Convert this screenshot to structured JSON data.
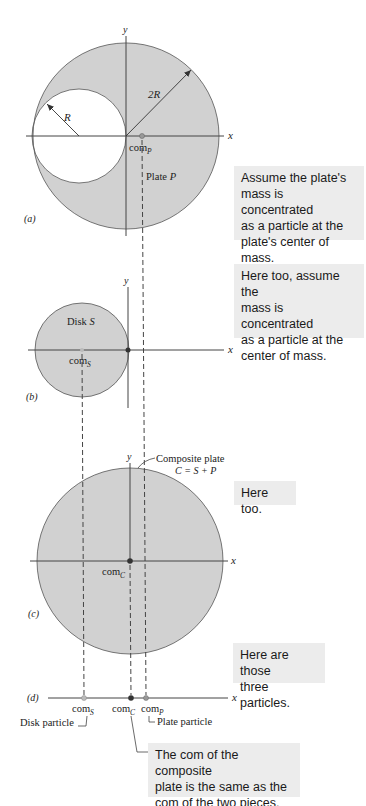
{
  "panels": {
    "a": {
      "label": "(a)",
      "x_axis": "x",
      "y_axis": "y",
      "outer_radius_label": "2R",
      "hole_radius_label": "R",
      "com_label": "com",
      "com_subscript": "P",
      "plate_label": "Plate",
      "plate_symbol": "P",
      "callout": "Assume the plate's\nmass is concentrated\nas a particle at the\nplate's center of mass."
    },
    "b": {
      "label": "(b)",
      "x_axis": "x",
      "y_axis": "y",
      "disk_label": "Disk",
      "disk_symbol": "S",
      "com_label": "com",
      "com_subscript": "S",
      "callout": "Here too, assume the\nmass is concentrated\nas a particle at the\ncenter of mass."
    },
    "c": {
      "label": "(c)",
      "x_axis": "x",
      "y_axis": "y",
      "composite_label": "Composite plate",
      "composite_equation": "C = S + P",
      "com_label": "com",
      "com_subscript": "C",
      "callout": "Here too."
    },
    "d": {
      "label": "(d)",
      "x_axis": "x",
      "com_s_label": "com",
      "com_s_subscript": "S",
      "com_c_label": "com",
      "com_c_subscript": "C",
      "com_p_label": "com",
      "com_p_subscript": "P",
      "disk_particle_label": "Disk particle",
      "plate_particle_label": "Plate particle",
      "callout_top": "Here are those\nthree particles.",
      "callout_bottom": "The com of the composite\nplate is the same as the\ncom of the two pieces."
    }
  },
  "colors": {
    "plate_fill": "#d1d1d1",
    "outline": "#555555",
    "axis": "#444444",
    "callout_bg": "#ececec",
    "com_dot": "#333333",
    "com_dot_light": "#999999"
  }
}
